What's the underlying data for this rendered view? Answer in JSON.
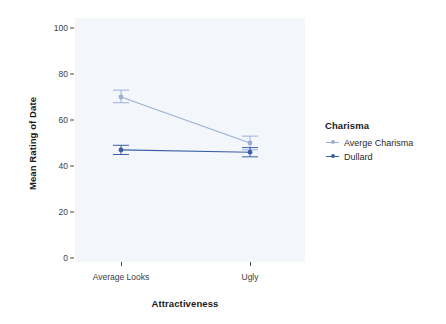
{
  "chart_data": {
    "type": "line",
    "title": "",
    "subtitle": "",
    "xlabel": "Attractiveness",
    "ylabel": "Mean Rating of Date",
    "categories": [
      "Average Looks",
      "Ugly"
    ],
    "ylim": [
      0,
      100
    ],
    "yticks": [
      0,
      20,
      40,
      60,
      80,
      100
    ],
    "ytick_labels": [
      "0",
      "20",
      "40",
      "60",
      "80",
      "100"
    ],
    "grid": false,
    "legend_position": "right",
    "legend_title": "Charisma",
    "series": [
      {
        "name": "Averge Charisma",
        "color": "#9aafd4",
        "values": [
          70,
          50
        ],
        "error_low": [
          67.5,
          47
        ],
        "error_high": [
          73,
          53
        ]
      },
      {
        "name": "Dullard",
        "color": "#3a5fa6",
        "values": [
          47,
          46
        ],
        "error_low": [
          45,
          44
        ],
        "error_high": [
          49,
          48
        ]
      }
    ],
    "panel_background": "#f3f7fb",
    "axis_text_color": "#3d3d3d",
    "axis_title_color": "#1a1a1a"
  },
  "legend": {
    "title": "Charisma",
    "entries": [
      {
        "label": "Averge Charisma",
        "color": "#9aafd4"
      },
      {
        "label": "Dullard",
        "color": "#3a5fa6"
      }
    ]
  },
  "axes": {
    "y_title": "Mean Rating of Date",
    "x_title": "Attractiveness",
    "y_tick_labels": [
      "100",
      "80",
      "60",
      "40",
      "20",
      "0"
    ],
    "x_tick_labels": [
      "Average Looks",
      "Ugly"
    ]
  }
}
